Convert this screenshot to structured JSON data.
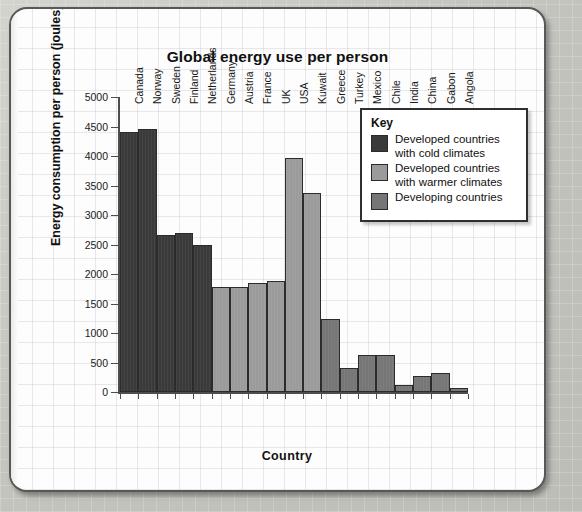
{
  "chart_data": {
    "type": "bar",
    "title": "Global energy use per person",
    "xlabel": "Country",
    "ylabel": "Energy consumption per person (joules)",
    "ylim": [
      0,
      5000
    ],
    "ytick_step": 500,
    "ytick_labels": [
      "5000",
      "4500",
      "4000",
      "3500",
      "3000",
      "2500",
      "2000",
      "1500",
      "1000",
      "500",
      "0"
    ],
    "grid": false,
    "legend_position": "upper-right-inside",
    "categories": [
      "Canada",
      "Norway",
      "Sweden",
      "Finland",
      "Netherlands",
      "Germany",
      "Austria",
      "France",
      "UK",
      "USA",
      "Kuwait",
      "Greece",
      "Turkey",
      "Mexico",
      "Chile",
      "India",
      "China",
      "Gabon",
      "Angola"
    ],
    "values": [
      4400,
      4450,
      2660,
      2690,
      2490,
      1780,
      1780,
      1840,
      1890,
      3970,
      3380,
      1230,
      400,
      625,
      620,
      120,
      275,
      320,
      70
    ],
    "groups": [
      "cold",
      "cold",
      "cold",
      "cold",
      "cold",
      "warm",
      "warm",
      "warm",
      "warm",
      "warm",
      "warm",
      "develop",
      "develop",
      "develop",
      "develop",
      "develop",
      "develop",
      "develop",
      "develop"
    ],
    "colors": {
      "cold": "#3a3a3a",
      "warm": "#9b9b9b",
      "develop": "#767676"
    },
    "legend": {
      "title": "Key",
      "entries": [
        {
          "key": "cold",
          "label": "Developed countries with cold climates"
        },
        {
          "key": "warm",
          "label": "Developed countries with warmer climates"
        },
        {
          "key": "develop",
          "label": "Developing countries"
        }
      ]
    }
  }
}
